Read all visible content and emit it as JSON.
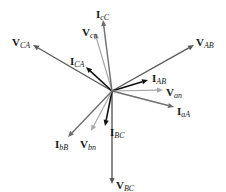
{
  "diagram": {
    "origin": [
      112,
      91
    ],
    "colors": {
      "line_voltage": "#5a5a5a",
      "phase_voltage": "#a8a8a8",
      "phase_current": "#111111",
      "line_current": "#6e6e6e"
    },
    "phasors": [
      {
        "id": "V_AB",
        "symbol": "V",
        "sub": "AB",
        "kind": "line_voltage",
        "end": [
          194,
          45
        ],
        "label_pos": [
          196,
          37
        ]
      },
      {
        "id": "I_AB",
        "symbol": "I",
        "sub": "AB",
        "kind": "phase_current",
        "end": [
          148,
          80
        ],
        "label_pos": [
          152,
          73
        ]
      },
      {
        "id": "V_an",
        "symbol": "V",
        "sub": "an",
        "kind": "phase_voltage",
        "end": [
          163,
          90
        ],
        "label_pos": [
          166,
          87
        ]
      },
      {
        "id": "I_aA",
        "symbol": "I",
        "sub": "aA",
        "kind": "line_current",
        "end": [
          174,
          107
        ],
        "label_pos": [
          177,
          106
        ]
      },
      {
        "id": "V_BC",
        "symbol": "V",
        "sub": "BC",
        "kind": "line_voltage",
        "end": [
          112,
          184
        ],
        "label_pos": [
          116,
          180
        ]
      },
      {
        "id": "I_BC",
        "symbol": "I",
        "sub": "BC",
        "kind": "phase_current",
        "end": [
          105,
          126
        ],
        "label_pos": [
          110,
          127
        ]
      },
      {
        "id": "V_bn",
        "symbol": "V",
        "sub": "bn",
        "kind": "phase_voltage",
        "end": [
          91,
          131
        ],
        "label_pos": [
          80,
          139
        ]
      },
      {
        "id": "I_bB",
        "symbol": "I",
        "sub": "bB",
        "kind": "line_current",
        "end": [
          68,
          137
        ],
        "label_pos": [
          55,
          139
        ]
      },
      {
        "id": "V_CA",
        "symbol": "V",
        "sub": "CA",
        "kind": "line_voltage",
        "end": [
          33,
          45
        ],
        "label_pos": [
          12,
          37
        ]
      },
      {
        "id": "I_CA",
        "symbol": "I",
        "sub": "CA",
        "kind": "phase_current",
        "end": [
          86,
          67
        ],
        "label_pos": [
          70,
          56
        ]
      },
      {
        "id": "V_cn",
        "symbol": "V",
        "sub": "cn",
        "kind": "phase_voltage",
        "end": [
          95,
          33
        ],
        "label_pos": [
          82,
          27
        ]
      },
      {
        "id": "I_cC",
        "symbol": "I",
        "sub": "cC",
        "kind": "line_current",
        "end": [
          103,
          20
        ],
        "label_pos": [
          96,
          9
        ]
      }
    ]
  }
}
